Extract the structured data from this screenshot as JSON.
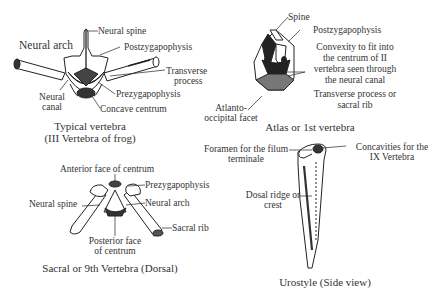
{
  "figure": {
    "panels": [
      {
        "id": "typical",
        "caption_line1": "Typical vertebra",
        "caption_line2": "(III Vertebra of frog)",
        "labels": {
          "neural_spine": "Neural spine",
          "neural_arch": "Neural arch",
          "postzygapophysis": "Postzygapophysis",
          "transverse_process_1": "Transverse",
          "transverse_process_2": "process",
          "neural_canal_1": "Neural",
          "neural_canal_2": "canal",
          "prezygapophysis": "Prezygapophysis",
          "concave_centrum": "Concave centrum"
        }
      },
      {
        "id": "atlas",
        "caption": "Atlas or 1st vertebra",
        "labels": {
          "spine": "Spine",
          "postzygapophysis": "Postzygapophysis",
          "convexity_1": "Convexity to fit into",
          "convexity_2": "the centrum of II",
          "convexity_3": "vertebra seen through",
          "convexity_4": "the neural canal",
          "transverse_1": "Transverse process or",
          "transverse_2": "sacral rib",
          "atlanto_1": "Atlanto-",
          "atlanto_2": "occipital facet"
        }
      },
      {
        "id": "sacral",
        "caption": "Sacral or 9th Vertebra (Dorsal)",
        "labels": {
          "anterior_face": "Anterior face of centrum",
          "prezygapophysis": "Prezygapophysis",
          "neural_spine": "Neural spine",
          "neural_arch": "Neural arch",
          "sacral_rib": "Sacral rib",
          "posterior_face_1": "Posterior face",
          "posterior_face_2": "of centrum"
        }
      },
      {
        "id": "urostyle",
        "caption": "Urostyle (Side view)",
        "labels": {
          "foramen_1": "Foramen for the filum",
          "foramen_2": "terminale",
          "concavities_1": "Concavities for the",
          "concavities_2": "IX Vertebra",
          "dorsal_ridge_1": "Dosal ridge or",
          "dorsal_ridge_2": "crest"
        }
      }
    ],
    "colors": {
      "ink": "#2a2a2a",
      "background": "#ffffff"
    }
  }
}
